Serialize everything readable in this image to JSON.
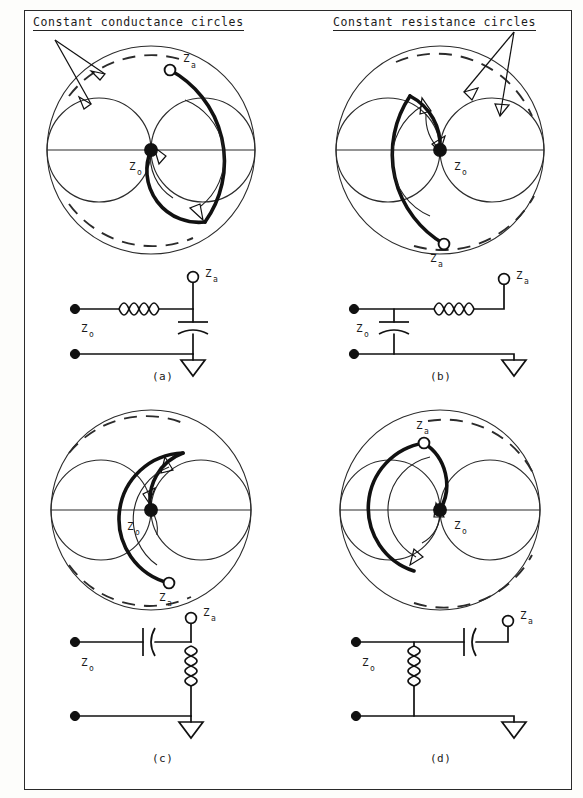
{
  "figure": {
    "headers": {
      "left": "Constant conductance circles",
      "right": "Constant resistance circles"
    },
    "panels": [
      {
        "id": "a",
        "caption": "(a)",
        "chart": {
          "center_label": "Z",
          "center_label_sub": "o",
          "point_label": "Z",
          "point_label_sub": "a",
          "point_position": "upper-right",
          "arc_direction": "clockwise-downward",
          "dashed_arc": "upper-and-lower",
          "annotated_circles": "constant conductance circles"
        },
        "circuit": {
          "source_label": "Z",
          "source_label_sub": "o",
          "load_label": "Z",
          "load_label_sub": "a",
          "series_element": "inductor",
          "shunt_element": "capacitor",
          "topology": "series-inductor-then-shunt-capacitor"
        }
      },
      {
        "id": "b",
        "caption": "(b)",
        "chart": {
          "center_label": "Z",
          "center_label_sub": "o",
          "point_label": "Z",
          "point_label_sub": "a",
          "point_position": "lower-left",
          "arc_direction": "counterclockwise-upward",
          "dashed_arc": "upper-and-lower",
          "annotated_circles": "constant resistance circles"
        },
        "circuit": {
          "source_label": "Z",
          "source_label_sub": "o",
          "load_label": "Z",
          "load_label_sub": "a",
          "series_element": "inductor",
          "shunt_element": "capacitor",
          "topology": "shunt-capacitor-then-series-inductor"
        }
      },
      {
        "id": "c",
        "caption": "(c)",
        "chart": {
          "center_label": "Z",
          "center_label_sub": "o",
          "point_label": "Z",
          "point_label_sub": "a",
          "point_position": "lower-right",
          "arc_direction": "counterclockwise-upward",
          "dashed_arc": "upper-and-lower",
          "annotated_circles": "constant conductance circles"
        },
        "circuit": {
          "source_label": "Z",
          "source_label_sub": "o",
          "load_label": "Z",
          "load_label_sub": "a",
          "series_element": "capacitor",
          "shunt_element": "inductor",
          "topology": "series-capacitor-then-shunt-inductor"
        }
      },
      {
        "id": "d",
        "caption": "(d)",
        "chart": {
          "center_label": "Z",
          "center_label_sub": "o",
          "point_label": "Z",
          "point_label_sub": "a",
          "point_position": "upper-left",
          "arc_direction": "clockwise-downward",
          "dashed_arc": "upper-and-lower",
          "annotated_circles": "constant resistance circles"
        },
        "circuit": {
          "source_label": "Z",
          "source_label_sub": "o",
          "load_label": "Z",
          "load_label_sub": "a",
          "series_element": "capacitor",
          "shunt_element": "inductor",
          "topology": "shunt-inductor-then-series-capacitor"
        }
      }
    ],
    "colors": {
      "ink": "#1a1a1a",
      "line": "#2b2b2b",
      "bold": "#111111",
      "paper": "#ffffff",
      "page": "#fdfdfb"
    }
  }
}
